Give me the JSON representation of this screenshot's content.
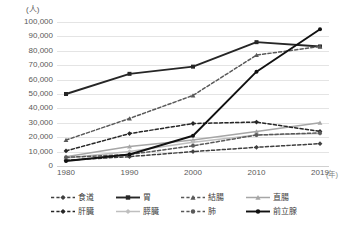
{
  "chart_data": {
    "type": "line",
    "title": "",
    "xlabel": "年",
    "ylabel": "人",
    "x": [
      1980,
      1990,
      2000,
      2010,
      2019
    ],
    "xticklabels": [
      "1980",
      "1990",
      "2000",
      "2010",
      "2019"
    ],
    "xunit": "(年)",
    "yunit": "(人)",
    "ylim": [
      0,
      100000
    ],
    "ytick_step": 10000,
    "yticklabels": [
      "100,000",
      "90,000",
      "80,000",
      "70,000",
      "60,000",
      "50,000",
      "40,000",
      "30,000",
      "20,000",
      "10,000",
      "0"
    ],
    "grid": true,
    "legend_position": "bottom",
    "series": [
      {
        "name": "食道",
        "color": "#404040",
        "dash": "dashed",
        "marker": "diamond",
        "values": [
          4000,
          6500,
          10000,
          13000,
          15500
        ]
      },
      {
        "name": "胃",
        "color": "#262626",
        "dash": "solid",
        "marker": "square",
        "values": [
          50000,
          64000,
          69000,
          86000,
          83000
        ]
      },
      {
        "name": "結腸",
        "color": "#595959",
        "dash": "dashed",
        "marker": "triangle",
        "values": [
          18000,
          33000,
          49000,
          77000,
          83000
        ]
      },
      {
        "name": "直腸",
        "color": "#a6a6a6",
        "dash": "solid",
        "marker": "triangle",
        "values": [
          6500,
          13500,
          18000,
          24000,
          30000
        ]
      },
      {
        "name": "肝臓",
        "color": "#262626",
        "dash": "dashed",
        "marker": "diamond",
        "values": [
          10500,
          22500,
          29500,
          30500,
          24000
        ]
      },
      {
        "name": "膵臓",
        "color": "#bfbfbf",
        "dash": "solid",
        "marker": "diamond",
        "values": [
          5500,
          10000,
          16500,
          21500,
          22500
        ]
      },
      {
        "name": "肺",
        "color": "#595959",
        "dash": "dashed",
        "marker": "circle",
        "values": [
          6000,
          8000,
          14000,
          21500,
          23000
        ]
      },
      {
        "name": "前立腺",
        "color": "#111111",
        "dash": "solid",
        "marker": "circle",
        "values": [
          3500,
          8000,
          21000,
          65500,
          95000
        ]
      }
    ]
  }
}
